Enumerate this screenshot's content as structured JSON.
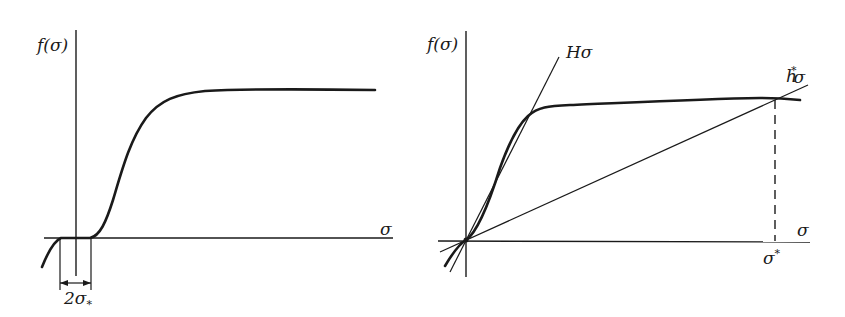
{
  "left_panel": {
    "y_axis_label": "f(σ)",
    "x_axis_label": "σ",
    "width_label": "2σ",
    "width_label_sub": "*",
    "description": "Sigmoid-like curve f(σ) with a flat region of width 2σ* around the origin, saturating at a plateau"
  },
  "right_panel": {
    "y_axis_label": "f(σ)",
    "x_axis_label": "σ",
    "tangent_line_label": "Hσ",
    "secant_line_label_main": "h",
    "secant_line_label_sup": "*",
    "secant_line_label_tail": "σ",
    "intersection_label": "σ",
    "intersection_label_sup": "*",
    "description": "Curve f(σ) passing through origin with tangent line Hσ and secant line h*σ intersecting the curve at σ*"
  },
  "colors": {
    "ink": "#1a1a1a",
    "background": "#ffffff"
  }
}
